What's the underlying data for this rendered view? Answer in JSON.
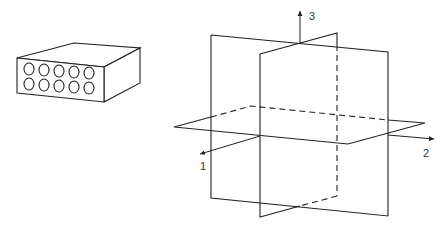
{
  "figure": {
    "axes": [
      {
        "id": "1",
        "label": "1"
      },
      {
        "id": "2",
        "label": "2"
      },
      {
        "id": "3",
        "label": "3"
      }
    ],
    "brick": {
      "hole_rows": 2,
      "hole_columns": 5
    },
    "colors": {
      "stroke": "#222222",
      "background": "#ffffff"
    }
  }
}
